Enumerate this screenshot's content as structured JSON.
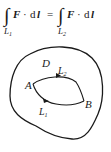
{
  "formula": {
    "lhs": {
      "integral_sign": "∫",
      "subscript": "L",
      "subscript_index": "1",
      "integrand_vec": "F",
      "dot": "·",
      "differential": "d",
      "differential_vec": "l"
    },
    "equals": "=",
    "rhs": {
      "integral_sign": "∫",
      "subscript": "L",
      "subscript_index": "2",
      "integrand_vec": "F",
      "dot": "·",
      "differential": "d",
      "differential_vec": "l"
    }
  },
  "diagram": {
    "region_label": "D",
    "point_a": "A",
    "point_b": "B",
    "path_upper": {
      "label": "L",
      "index": "2"
    },
    "path_lower": {
      "label": "L",
      "index": "1"
    },
    "stroke_color": "#1a1a1a"
  }
}
